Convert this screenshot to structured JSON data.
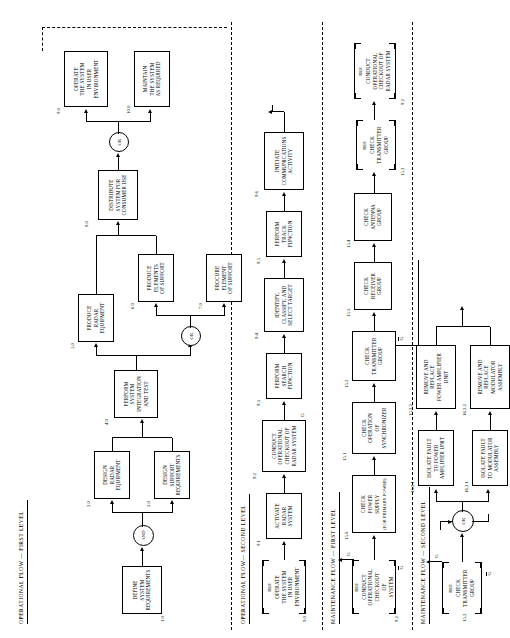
{
  "figure": {
    "orientation": "rotated-90",
    "sections": [
      {
        "id": "op1",
        "label": "OPERATIONAL FLOW — FIRST LEVEL"
      },
      {
        "id": "op2",
        "label": "OPERATIONAL FLOW— SECOND LEVEL"
      },
      {
        "id": "mt1",
        "label": "MAINTENANCE FLOW — FIRST LEVEL"
      },
      {
        "id": "mt2",
        "label": "MAINTENANCE FLOW — SECOND LEVEL"
      }
    ],
    "gates": {
      "and": "AND",
      "or": "OR"
    },
    "ref_label": "REF.",
    "signal_labels": {
      "g": "G",
      "g_not": "G"
    },
    "blocks": {
      "b1": {
        "num": "1.0",
        "lines": [
          "DEFINE",
          "SYSTEM",
          "REQUIREMENTS"
        ]
      },
      "b2": {
        "num": "2.0",
        "lines": [
          "DESIGN",
          "RADAR",
          "EQUIPMENT"
        ]
      },
      "b3": {
        "num": "3.0",
        "lines": [
          "DESIGN",
          "SUPPORT",
          "REQUIREMENTS"
        ]
      },
      "b4": {
        "num": "4.0",
        "lines": [
          "PERFORM",
          "SYSTEM",
          "INTEGRATION",
          "AND TEST"
        ]
      },
      "b5": {
        "num": "5.0",
        "lines": [
          "PRODUCE",
          "RADAR",
          "EQUIPMENT"
        ]
      },
      "b6": {
        "num": "6.0",
        "lines": [
          "PRODUCE",
          "ELEMENTS",
          "OF SUPPORT"
        ]
      },
      "b7": {
        "num": "7.0",
        "lines": [
          "PROCURE",
          "ELEMENT",
          "OF SUPPORT"
        ]
      },
      "b8": {
        "num": "8.0",
        "lines": [
          "DISTRIBUTE",
          "SYSTEM FOR",
          "CONSUMER USE"
        ]
      },
      "b9": {
        "num": "9.0",
        "lines": [
          "OPERATE",
          "THE SYSTEM",
          "IN USER",
          "ENVIRONMENT"
        ]
      },
      "b10": {
        "num": "10.0",
        "lines": [
          "MAINTAIN",
          "THE SYSTEM",
          "AS REQUIRED"
        ]
      },
      "b9ref": {
        "num": "9.0",
        "lines": [
          "OPERATE",
          "THE SYSTEM",
          "IN USER",
          "ENVIRONMENT"
        ]
      },
      "b91": {
        "num": "9.1",
        "lines": [
          "ACTIVATE",
          "RADAR",
          "SYSTEM"
        ]
      },
      "b92": {
        "num": "9.2",
        "lines": [
          "CONDUCT",
          "OPERATIONAL",
          "CHECKOUT OF",
          "RADAR SYSTEM"
        ]
      },
      "b93": {
        "num": "9.3",
        "lines": [
          "PERFORM",
          "SEARCH",
          "FUNCTION"
        ]
      },
      "b94": {
        "num": "9.4",
        "lines": [
          "IDENTIFY,",
          "CLASSIFY, AND",
          "SELECT TARGET"
        ]
      },
      "b95": {
        "num": "9.5",
        "lines": [
          "PERFORM",
          "TRACK",
          "FUNCTION"
        ]
      },
      "b96": {
        "num": "9.6",
        "lines": [
          "INITIATE",
          "COMMUNICATIONS",
          "ACTIVITY"
        ]
      },
      "b92ref": {
        "num": "9.2",
        "lines": [
          "CONDUCT",
          "OPERATIONAL",
          "CHECKOUT",
          "OF",
          "SYSTEM"
        ]
      },
      "b150": {
        "num": "15.0",
        "lines": [
          "CHECK",
          "POWER",
          "SUPPLY"
        ],
        "sub": "(FOR PRIMARY POWER)"
      },
      "b151": {
        "num": "15.1",
        "lines": [
          "CHECK",
          "OPERATION",
          "OF",
          "SYNCHRONIZER"
        ]
      },
      "b152": {
        "num": "15.2",
        "lines": [
          "CHECK",
          "TRANSMITTER",
          "GROUP"
        ]
      },
      "b153": {
        "num": "15.3",
        "lines": [
          "CHECK",
          "RECEIVER",
          "GROUP"
        ]
      },
      "b154": {
        "num": "15.4",
        "lines": [
          "CHECK",
          "ANTENNA",
          "GROUP"
        ]
      },
      "b152ref_low": {
        "num": "15.2",
        "lines": [
          "CHECK",
          "TRANSMITTER",
          "GROUP"
        ]
      },
      "b152ref_top": {
        "num": "15.2",
        "lines": [
          "CHECK",
          "TRANSMITTER",
          "GROUP"
        ]
      },
      "b92ref_top": {
        "num": "9.2",
        "lines": [
          "CONDUCT",
          "OPERATIONAL",
          "CHECKOUT OF",
          "RADAR SYSTEM"
        ]
      },
      "b1521": {
        "num": "15.2.1",
        "lines": [
          "ISOLATE FAULT",
          "TO POWER",
          "AMPLIFIER UNIT"
        ]
      },
      "b1621": {
        "num": "16.2.1",
        "lines": [
          "ISOLATE FAULT",
          "TO MODULATOR",
          "ASSEMBLY"
        ]
      },
      "b1522": {
        "num": "15.2.2",
        "lines": [
          "REMOVE AND REPLACE",
          "POWER AMPLIFIER",
          "UNIT"
        ]
      },
      "b1622": {
        "num": "16.2.2",
        "lines": [
          "REMOVE AND REPLACE",
          "MODULATOR",
          "ASSEMBLY"
        ]
      }
    }
  }
}
